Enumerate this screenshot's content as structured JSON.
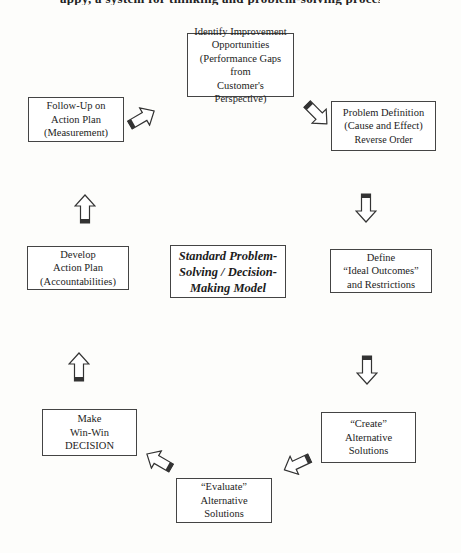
{
  "top_cut_text": "appy, a system for thinking and problem-solving process",
  "center": {
    "lines": [
      "Standard Problem-",
      "Solving / Decision-",
      "Making Model"
    ]
  },
  "steps": [
    {
      "id": "identify",
      "lines": [
        "Identify Improvement",
        "Opportunities",
        "(Performance Gaps from",
        "Customer's Perspective)"
      ]
    },
    {
      "id": "problem-definition",
      "lines": [
        "Problem Definition",
        "(Cause and Effect)",
        "Reverse Order"
      ]
    },
    {
      "id": "define-outcomes",
      "lines": [
        "Define",
        "“Ideal Outcomes”",
        "and Restrictions"
      ]
    },
    {
      "id": "create-alternatives",
      "lines": [
        "“Create”",
        "Alternative Solutions"
      ]
    },
    {
      "id": "evaluate-alternatives",
      "lines": [
        "“Evaluate”",
        "Alternative",
        "Solutions"
      ]
    },
    {
      "id": "make-decision",
      "lines": [
        "Make",
        "Win-Win",
        "DECISION"
      ]
    },
    {
      "id": "develop-plan",
      "lines": [
        "Develop",
        "Action Plan",
        "(Accountabilities)"
      ]
    },
    {
      "id": "follow-up",
      "lines": [
        "Follow-Up on",
        "Action Plan",
        "(Measurement)"
      ]
    }
  ],
  "arrows": [
    {
      "from": "identify",
      "to": "problem-definition",
      "direction": "down-right"
    },
    {
      "from": "problem-definition",
      "to": "define-outcomes",
      "direction": "down"
    },
    {
      "from": "define-outcomes",
      "to": "create-alternatives",
      "direction": "down"
    },
    {
      "from": "create-alternatives",
      "to": "evaluate-alternatives",
      "direction": "down-left"
    },
    {
      "from": "evaluate-alternatives",
      "to": "make-decision",
      "direction": "up-left"
    },
    {
      "from": "make-decision",
      "to": "develop-plan",
      "direction": "up"
    },
    {
      "from": "develop-plan",
      "to": "follow-up",
      "direction": "up"
    },
    {
      "from": "follow-up",
      "to": "identify",
      "direction": "up-right"
    }
  ]
}
